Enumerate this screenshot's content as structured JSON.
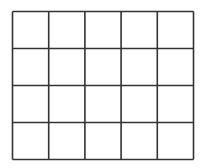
{
  "grid": {
    "columns": 5,
    "rows": 4,
    "line_color": "#333333",
    "cell_fill": "#ffffff",
    "cells_filled": []
  }
}
